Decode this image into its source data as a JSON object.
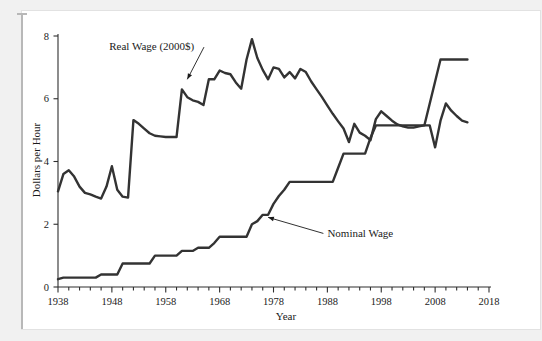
{
  "chart_data": {
    "type": "line",
    "title": "",
    "xlabel": "Year",
    "ylabel": "Dollars per Hour",
    "xlim": [
      1938,
      2018
    ],
    "ylim": [
      0,
      8
    ],
    "ytick_values": [
      0,
      2,
      4,
      6,
      8
    ],
    "ytick_labels": [
      "0",
      "2",
      "4",
      "6",
      "8"
    ],
    "xtick_labels": [
      "1938",
      "1948",
      "1958",
      "1968",
      "1978",
      "1988",
      "1998",
      "2008",
      "2018"
    ],
    "xtick_values": [
      1938,
      1948,
      1958,
      1968,
      1978,
      1988,
      1998,
      2008,
      2018
    ],
    "xminor_step": 2,
    "grid": false,
    "legend_position": "inline-annotations",
    "line_color": "#333333",
    "annotations": [
      {
        "text": "Real Wage (2000$)",
        "series": "Real Wage (2000$)",
        "label_x": 1947.5,
        "label_y": 7.55,
        "point_x": 1962.0,
        "point_y": 6.62
      },
      {
        "text": "Nominal Wage",
        "series": "Nominal Wage",
        "label_x": 1988.0,
        "label_y": 1.58,
        "point_x": 1977.0,
        "point_y": 2.22
      }
    ],
    "series": [
      {
        "name": "Real Wage (2000$)",
        "x": [
          1938,
          1939,
          1940,
          1941,
          1942,
          1943,
          1944,
          1945,
          1946,
          1947,
          1948,
          1949,
          1950,
          1951,
          1952,
          1953,
          1954,
          1955,
          1956,
          1957,
          1958,
          1959,
          1960,
          1961,
          1962,
          1963,
          1964,
          1965,
          1966,
          1967,
          1968,
          1969,
          1970,
          1971,
          1972,
          1973,
          1974,
          1975,
          1976,
          1977,
          1978,
          1979,
          1980,
          1981,
          1982,
          1983,
          1984,
          1985,
          1986,
          1987,
          1988,
          1989,
          1990,
          1991,
          1992,
          1993,
          1994,
          1995,
          1996,
          1997,
          1998,
          1999,
          2000,
          2001,
          2002,
          2003,
          2004,
          2005,
          2006,
          2007,
          2008,
          2009,
          2010,
          2011,
          2012,
          2013,
          2014
        ],
        "y": [
          3.05,
          3.6,
          3.72,
          3.52,
          3.2,
          3.0,
          2.95,
          2.88,
          2.82,
          3.2,
          3.85,
          3.1,
          2.88,
          2.85,
          5.32,
          5.2,
          5.05,
          4.9,
          4.82,
          4.8,
          4.78,
          4.78,
          4.78,
          6.3,
          6.05,
          5.95,
          5.9,
          5.8,
          6.62,
          6.62,
          6.9,
          6.82,
          6.78,
          6.52,
          6.32,
          7.25,
          7.9,
          7.3,
          6.92,
          6.62,
          7.0,
          6.95,
          6.68,
          6.85,
          6.65,
          6.95,
          6.85,
          6.55,
          6.3,
          6.05,
          5.78,
          5.52,
          5.28,
          5.05,
          4.62,
          5.2,
          4.92,
          4.82,
          4.68,
          5.35,
          5.6,
          5.45,
          5.3,
          5.18,
          5.12,
          5.08,
          5.08,
          5.12,
          5.15,
          5.15,
          4.45,
          5.3,
          5.85,
          5.62,
          5.45,
          5.3,
          5.25
        ]
      },
      {
        "name": "Nominal Wage",
        "x": [
          1938,
          1939,
          1940,
          1941,
          1942,
          1943,
          1944,
          1945,
          1946,
          1947,
          1948,
          1949,
          1950,
          1951,
          1952,
          1953,
          1954,
          1955,
          1956,
          1957,
          1958,
          1959,
          1960,
          1961,
          1962,
          1963,
          1964,
          1965,
          1966,
          1967,
          1968,
          1969,
          1970,
          1971,
          1972,
          1973,
          1974,
          1975,
          1976,
          1977,
          1978,
          1979,
          1980,
          1981,
          1982,
          1983,
          1984,
          1985,
          1986,
          1987,
          1988,
          1989,
          1990,
          1991,
          1992,
          1993,
          1994,
          1995,
          1996,
          1997,
          1998,
          1999,
          2000,
          2001,
          2002,
          2003,
          2004,
          2005,
          2006,
          2007,
          2008,
          2009,
          2010,
          2011,
          2012,
          2013,
          2014
        ],
        "y": [
          0.25,
          0.3,
          0.3,
          0.3,
          0.3,
          0.3,
          0.3,
          0.3,
          0.4,
          0.4,
          0.4,
          0.4,
          0.75,
          0.75,
          0.75,
          0.75,
          0.75,
          0.75,
          1.0,
          1.0,
          1.0,
          1.0,
          1.0,
          1.15,
          1.15,
          1.15,
          1.25,
          1.25,
          1.25,
          1.4,
          1.6,
          1.6,
          1.6,
          1.6,
          1.6,
          1.6,
          2.0,
          2.1,
          2.3,
          2.3,
          2.65,
          2.9,
          3.1,
          3.35,
          3.35,
          3.35,
          3.35,
          3.35,
          3.35,
          3.35,
          3.35,
          3.35,
          3.8,
          4.25,
          4.25,
          4.25,
          4.25,
          4.25,
          4.75,
          5.15,
          5.15,
          5.15,
          5.15,
          5.15,
          5.15,
          5.15,
          5.15,
          5.15,
          5.15,
          5.85,
          6.55,
          7.25,
          7.25,
          7.25,
          7.25,
          7.25,
          7.25
        ]
      }
    ]
  }
}
